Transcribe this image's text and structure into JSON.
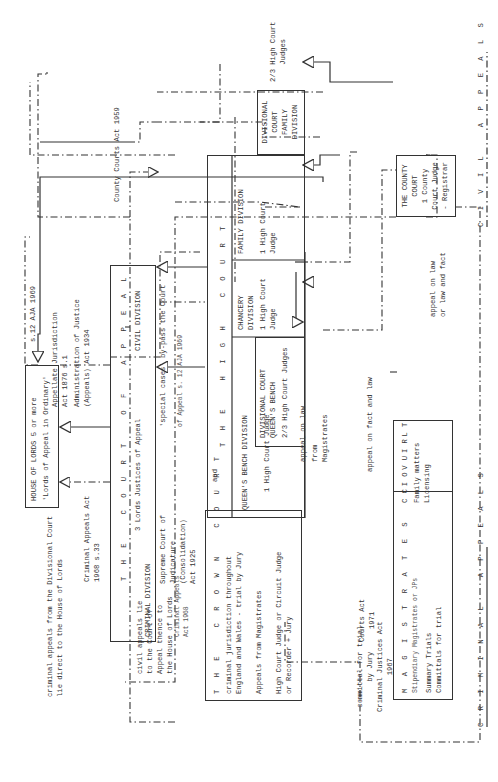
{
  "diagram": {
    "title_civil": "C I V I L   A P P E A L S",
    "title_criminal": "C R I M I N A L   A P P E A L S",
    "house_of_lords": {
      "line1": "HOUSE OF LORDS 5 or more",
      "line2": "'Lords of Appeal in Ordinary'"
    },
    "court_of_appeal": {
      "title": "T H E   C O U R T   O F   A P P E A L",
      "subtitle": "3 Lords Justices of Appeal",
      "civil_division": "CIVIL DIVISION",
      "criminal_division": "CRIMINAL DIVISION"
    },
    "high_court": {
      "title": "T H E   H I G H   C O U R T",
      "divisions": [
        {
          "name": "QUEEN'S BENCH DIVISION",
          "judges": "1 High Court Judge"
        },
        {
          "name": "CHANCERY\nDIVISION",
          "judges": "1 High Court\nJudge"
        },
        {
          "name": "FAMILY DIVISION",
          "judges": "1 High Court\nJudge"
        }
      ],
      "divisional_qb": {
        "name": "DIVISIONAL COURT\nQUEEN'S BENCH",
        "judges": "2/3 High Court Judges"
      },
      "divisional_family": {
        "name": "DIVISIONAL\nCOURT\nFAMILY\nDIVISION",
        "judges": "2/3 High Court\nJudges"
      }
    },
    "county_court": {
      "text": "THE COUNTY\nCOURT\n1 County\nCourt Judge\n- Registrar"
    },
    "crown_court": {
      "title": "T H E   C R O W N   C O U R T",
      "desc": "criminal jurisdiction throughout\nEngland and Wales - trial by Jury",
      "appeals": "Appeals from Magistrates",
      "judges": "High Court Judge or Circuit Judge\nor Recorder + Jury"
    },
    "magistrates": {
      "title": "M A G I S T R A T E S   C O U R T",
      "sub": "Stipendiary Magistrates or JPs",
      "items": "Summary Trials\nCommittals for trial",
      "civil_title": "C I V I L",
      "civil_items": "Family matters\nLicensing"
    },
    "annotations": {
      "county_courts_act": "County Courts Act 1959",
      "s12_aja": "s.12 AJA 1969",
      "appellate_jurisdiction": "Appellate Jurisdiction\nAct 1876 s.1",
      "admin_justice": "Administration of Justice\n(Appeals) Act 1934",
      "special_cases": "'special cases' by-pass the Court",
      "of_appeal_s12": "of Appeal s. 12 AJA 1969",
      "supreme_court_act": "Supreme Court of\nJudicature\n(Consolidation)\nAct 1925",
      "and": "and",
      "criminal_appeals_act_1968_s33": "Criminal Appeals Act\n1968 s.33",
      "criminal_appeals_act_1968": "Criminal Appeals\nAct 1968",
      "criminal_from_divisional": "criminal appeals from the Divisional Court\nlie direct to the House of Lords",
      "civil_appeals_lie": "civil appeals lie\nto the Court of\nAppeal thence to\nthe House of Lords",
      "appeal_on_law": "appeal on law",
      "from_magistrates": "from\nMagistrates",
      "appeal_fact_law": "appeal on fact and law",
      "appeal_law_or_fact": "appeal on law\nor law and fact",
      "courts_act_1971": "Courts Act\n1971",
      "committal": "committal for trial\nby Jury\nCriminal Justices Act\n1967"
    }
  }
}
